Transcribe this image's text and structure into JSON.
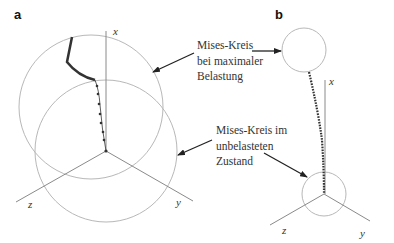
{
  "panels": {
    "a": {
      "label": "a",
      "axes": {
        "x": "x",
        "y": "y",
        "z": "z"
      }
    },
    "b": {
      "label": "b",
      "axes": {
        "x": "x",
        "y": "y",
        "z": "z"
      }
    }
  },
  "annotations": {
    "max_load": {
      "lines": [
        "Mises-Kreis",
        "bei maximaler",
        "Belastung"
      ]
    },
    "unloaded": {
      "lines": [
        "Mises-Kreis im",
        "unbelasteten",
        "Zustand"
      ]
    }
  },
  "colors": {
    "circle": "#b8b8b8",
    "axis": "#8a8a8a",
    "path": "#333333",
    "arrow": "#222222",
    "text": "#333333"
  }
}
